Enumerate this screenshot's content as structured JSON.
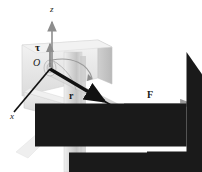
{
  "figure": {
    "background_color": "#ffffff",
    "ink_color": "#1a1a1a"
  },
  "axes": {
    "z": {
      "label": "z",
      "x": 50,
      "y": 9
    },
    "x": {
      "label": "x",
      "x": 10,
      "y": 116
    },
    "y": {
      "label": "y",
      "x": 160,
      "y": 133
    }
  },
  "origin": {
    "label": "O",
    "x": 33,
    "y": 62
  },
  "vectors": [
    {
      "name": "torque",
      "label": "τ",
      "overbar": true,
      "x": 35,
      "y": 42
    },
    {
      "name": "position",
      "label": "r",
      "overbar": true,
      "x": 69,
      "y": 91
    },
    {
      "name": "force",
      "label": "F",
      "overbar": true,
      "x": 147,
      "y": 90
    }
  ],
  "angle": {
    "label": "30.0°",
    "value": 30.0,
    "unit": "degrees",
    "x": 133,
    "y": 106
  },
  "colors": {
    "wall_light": "#e9e9e9",
    "wall_mid": "#d6d6d6",
    "wall_dark": "#c2c2c2",
    "post_light": "#e4e4e4",
    "post_dark": "#bdbdbd",
    "vector_black": "#111111",
    "axis_gray": "#8d8d8d",
    "force_gray": "#9a9a9a"
  }
}
